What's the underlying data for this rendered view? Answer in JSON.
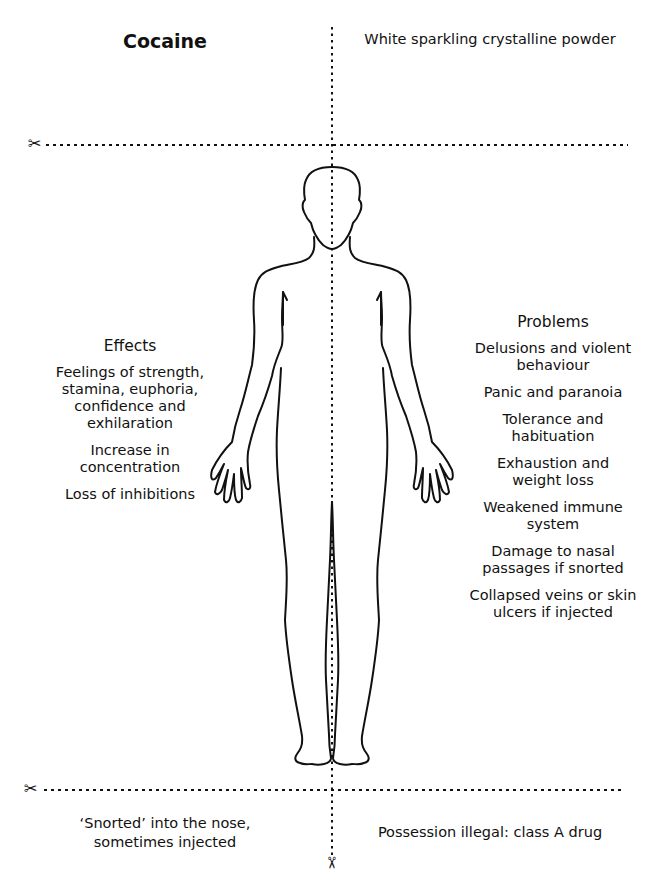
{
  "card": {
    "title": "Cocaine",
    "appearance": "White sparkling crystalline powder",
    "effects": {
      "heading": "Effects",
      "items": [
        "Feelings of strength, stamina, euphoria, confidence and exhilaration",
        "Increase in concentration",
        "Loss of inhibitions"
      ]
    },
    "problems": {
      "heading": "Problems",
      "items": [
        "Delusions and violent behaviour",
        "Panic and paranoia",
        "Tolerance and habituation",
        "Exhaustion and weight loss",
        "Weakened immune system",
        "Damage to nasal passages if snorted",
        "Collapsed veins or skin ulcers if injected"
      ]
    },
    "route": "‘Snorted’ into the nose, sometimes injected",
    "legal_status": "Possession illegal: class A drug"
  },
  "icons": {
    "scissors": "✂",
    "figure": "human-body-outline"
  },
  "colors": {
    "ink": "#111111",
    "background": "#ffffff"
  }
}
